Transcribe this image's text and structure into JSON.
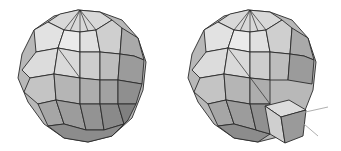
{
  "figure": {
    "panels": [
      {
        "name": "sphere-plain",
        "shape": "faceted-sphere"
      },
      {
        "name": "sphere-with-cube",
        "shape": "faceted-sphere",
        "attachment": "cube-with-axes"
      }
    ],
    "colors": {
      "light": "#e6e6e6",
      "mid": "#c8c8c8",
      "dark": "#a8a8a8",
      "darker": "#8e8e8e",
      "edge": "#2a2a2a",
      "axis": "#9a9a9a"
    }
  }
}
